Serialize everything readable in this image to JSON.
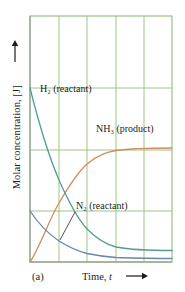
{
  "figure": {
    "panel_label": "(a)",
    "y_axis_title": "Molar concentration, [J]",
    "y_axis_arrow": "⟶",
    "x_axis_title": "Time, t",
    "x_axis_arrow": "⟶"
  },
  "labels": {
    "h2": "H₂ (reactant)",
    "nh3": "NH₃ (product)",
    "n2": "N₂ (reactant)"
  },
  "colors": {
    "grid": "#8fbf77",
    "frame": "#8fbf77",
    "h2_curve": "#4f9e91",
    "n2_curve": "#6a86a8",
    "nh3_curve": "#cf8a63",
    "text": "#1c1c1c",
    "background": "#ffffff"
  },
  "chart_data": {
    "type": "line",
    "title": "",
    "subtitle": "",
    "xlabel": "Time, t",
    "ylabel": "Molar concentration, [J]",
    "panel": "(a)",
    "xlim": [
      0,
      5
    ],
    "ylim": [
      0,
      4
    ],
    "grid": true,
    "x_tick_labels": [],
    "y_tick_labels": [],
    "x_gridlines": [
      0,
      1,
      2,
      3,
      4,
      5
    ],
    "y_gridlines": [
      0,
      1,
      2,
      3,
      4
    ],
    "legend_position": "inline-annotations",
    "annotations": [
      {
        "text": "H₂ (reactant)",
        "x": 0.35,
        "y": 3.05,
        "series": "H2"
      },
      {
        "text": "NH₃ (product)",
        "x": 2.35,
        "y": 2.38,
        "series": "NH3"
      },
      {
        "text": "N₂ (reactant)",
        "x": 1.65,
        "y": 1.1,
        "series": "N2",
        "leader_line": true
      },
      {
        "text": "(a)",
        "x": 0.05,
        "y": -0.45,
        "series": null
      }
    ],
    "series": [
      {
        "name": "H2",
        "label": "H₂ (reactant)",
        "color": "#4f9e91",
        "kind": "exponential-decay",
        "x": [
          0,
          0.25,
          0.5,
          0.75,
          1,
          1.25,
          1.5,
          1.75,
          2,
          2.5,
          3,
          3.5,
          4,
          4.5,
          5
        ],
        "y": [
          3.6,
          3.06,
          2.58,
          2.18,
          1.84,
          1.56,
          1.33,
          1.14,
          0.98,
          0.74,
          0.58,
          0.47,
          0.4,
          0.35,
          0.32
        ]
      },
      {
        "name": "N2",
        "label": "N₂ (reactant)",
        "color": "#6a86a8",
        "kind": "exponential-decay",
        "x": [
          0,
          0.25,
          0.5,
          0.75,
          1,
          1.25,
          1.5,
          1.75,
          2,
          2.5,
          3,
          3.5,
          4,
          4.5,
          5
        ],
        "y": [
          1.2,
          1.02,
          0.86,
          0.73,
          0.61,
          0.52,
          0.44,
          0.38,
          0.33,
          0.25,
          0.19,
          0.15,
          0.13,
          0.11,
          0.1
        ]
      },
      {
        "name": "NH3",
        "label": "NH₃ (product)",
        "color": "#cf8a63",
        "kind": "exponential-rise",
        "x": [
          0,
          0.25,
          0.5,
          0.75,
          1,
          1.25,
          1.5,
          1.75,
          2,
          2.5,
          3,
          3.5,
          4,
          4.5,
          5
        ],
        "y": [
          0.0,
          0.4,
          0.74,
          1.03,
          1.28,
          1.49,
          1.67,
          1.82,
          1.95,
          2.14,
          2.27,
          2.35,
          2.4,
          2.43,
          2.45
        ]
      }
    ]
  }
}
